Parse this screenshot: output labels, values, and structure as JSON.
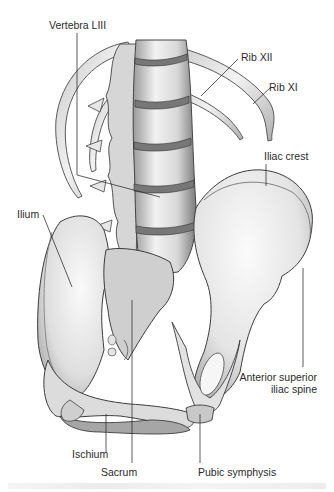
{
  "figure": {
    "labels": {
      "vertebra": "Vertebra LIII",
      "rib12": "Rib XII",
      "rib11": "Rib XI",
      "iliac_crest": "Iliac crest",
      "ilium": "Ilium",
      "asis_line1": "Anterior superior",
      "asis_line2": "iliac spine",
      "ischium": "Ischium",
      "sacrum": "Sacrum",
      "pubic_symphysis": "Pubic symphysis"
    },
    "colors": {
      "bone_light": "#f4f4f4",
      "bone_mid": "#cfcfcf",
      "bone_dark": "#8a8a8a",
      "outline": "#3c3c3c",
      "leader": "#333333",
      "text": "#2a2a2a"
    }
  }
}
